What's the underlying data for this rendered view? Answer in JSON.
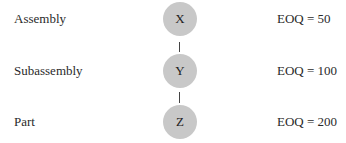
{
  "diagram": {
    "levels": [
      {
        "name": "Assembly",
        "node": "X",
        "eoq": "EOQ = 50"
      },
      {
        "name": "Subassembly",
        "node": "Y",
        "eoq": "EOQ = 100"
      },
      {
        "name": "Part",
        "node": "Z",
        "eoq": "EOQ = 200"
      }
    ],
    "colors": {
      "node_fill": "#c8c8c8",
      "connector": "#444444",
      "text": "#2a2a2a"
    }
  }
}
